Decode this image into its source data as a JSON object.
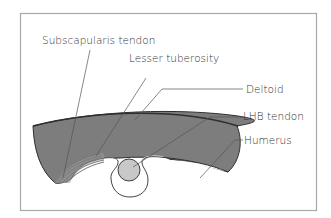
{
  "diagram": {
    "labels": {
      "subscapularis_tendon": "Subscapularis tendon",
      "lesser_tuberosity": "Lesser tuberosity",
      "deltoid": "Deltoid",
      "lhb_tendon": "LHB tendon",
      "humerus": "Humerus"
    },
    "colors": {
      "frame": "#a8a8a8",
      "deltoid_fill": "#7d7d7d",
      "outline": "#2f2f2f",
      "tendon_fill": "#c8c8c8",
      "leader": "#555555",
      "background": "#ffffff"
    }
  }
}
